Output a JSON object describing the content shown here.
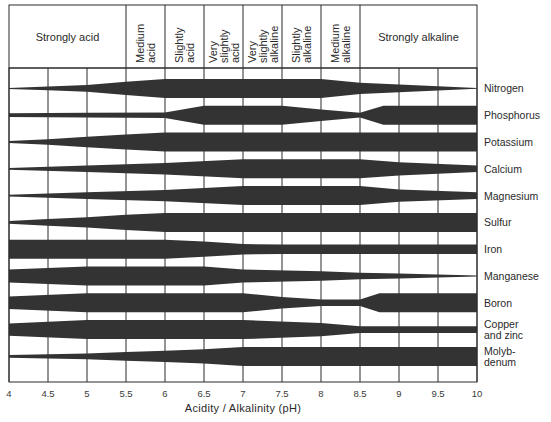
{
  "chart_data": {
    "type": "area",
    "title": "",
    "xlabel": "Acidity / Alkalinity (pH)",
    "ylabel": "",
    "xlim": [
      4,
      10
    ],
    "x_ticks": [
      "4",
      "4.5",
      "5",
      "5.5",
      "6",
      "6.5",
      "7",
      "7.5",
      "8",
      "8.5",
      "9",
      "9.5",
      "10"
    ],
    "grid": true,
    "legend": null,
    "value_meaning": "Relative nutrient availability (band thickness, 0 = none, 1 = maximum)",
    "ph_zones": [
      {
        "label": "Strongly acid",
        "lines": [
          "Strongly acid"
        ],
        "from": 4.0,
        "to": 5.5,
        "orientation": "horizontal"
      },
      {
        "label": "Medium acid",
        "lines": [
          "Medium",
          "acid"
        ],
        "from": 5.5,
        "to": 6.0,
        "orientation": "vertical"
      },
      {
        "label": "Slightly acid",
        "lines": [
          "Slightly",
          "acid"
        ],
        "from": 6.0,
        "to": 6.5,
        "orientation": "vertical"
      },
      {
        "label": "Very slightly acid",
        "lines": [
          "Very",
          "slightly",
          "acid"
        ],
        "from": 6.5,
        "to": 7.0,
        "orientation": "vertical"
      },
      {
        "label": "Very slightly alkaline",
        "lines": [
          "Very",
          "slightly",
          "alkaline"
        ],
        "from": 7.0,
        "to": 7.5,
        "orientation": "vertical"
      },
      {
        "label": "Slightly alkaline",
        "lines": [
          "Slightly",
          "alkaline"
        ],
        "from": 7.5,
        "to": 8.0,
        "orientation": "vertical"
      },
      {
        "label": "Medium alkaline",
        "lines": [
          "Medium",
          "alkaline"
        ],
        "from": 8.0,
        "to": 8.5,
        "orientation": "vertical"
      },
      {
        "label": "Strongly alkaline",
        "lines": [
          "Strongly alkaline"
        ],
        "from": 8.5,
        "to": 10.0,
        "orientation": "horizontal"
      }
    ],
    "series": [
      {
        "name": "Nitrogen",
        "label_lines": [
          "Nitrogen"
        ],
        "points": [
          [
            4,
            0.05
          ],
          [
            4.5,
            0.2
          ],
          [
            5,
            0.35
          ],
          [
            5.5,
            0.7
          ],
          [
            6,
            1
          ],
          [
            8,
            1
          ],
          [
            8.5,
            0.6
          ],
          [
            9,
            0.4
          ],
          [
            9.5,
            0.22
          ],
          [
            10,
            0.03
          ]
        ]
      },
      {
        "name": "Phosphorus",
        "label_lines": [
          "Phosphorus"
        ],
        "points": [
          [
            4,
            0.2
          ],
          [
            5,
            0.25
          ],
          [
            6,
            0.3
          ],
          [
            6.5,
            1
          ],
          [
            7.5,
            1
          ],
          [
            8,
            0.6
          ],
          [
            8.5,
            0.25
          ],
          [
            8.8,
            1
          ],
          [
            10,
            1
          ]
        ]
      },
      {
        "name": "Potassium",
        "label_lines": [
          "Potassium"
        ],
        "points": [
          [
            4,
            0.1
          ],
          [
            4.5,
            0.3
          ],
          [
            5,
            0.55
          ],
          [
            5.5,
            0.8
          ],
          [
            6,
            1
          ],
          [
            10,
            1
          ]
        ]
      },
      {
        "name": "Calcium",
        "label_lines": [
          "Calcium"
        ],
        "points": [
          [
            4,
            0.1
          ],
          [
            5,
            0.35
          ],
          [
            6,
            0.6
          ],
          [
            7,
            1
          ],
          [
            8.5,
            1
          ],
          [
            9,
            0.7
          ],
          [
            10,
            0.35
          ]
        ]
      },
      {
        "name": "Magnesium",
        "label_lines": [
          "Magnesium"
        ],
        "points": [
          [
            4,
            0.1
          ],
          [
            5,
            0.35
          ],
          [
            6,
            0.6
          ],
          [
            7,
            1
          ],
          [
            8.5,
            1
          ],
          [
            9,
            0.65
          ],
          [
            10,
            0.35
          ]
        ]
      },
      {
        "name": "Sulfur",
        "label_lines": [
          "Sulfur"
        ],
        "points": [
          [
            4,
            0.15
          ],
          [
            4.5,
            0.35
          ],
          [
            5,
            0.55
          ],
          [
            5.5,
            0.8
          ],
          [
            6,
            1
          ],
          [
            10,
            1
          ]
        ]
      },
      {
        "name": "Iron",
        "label_lines": [
          "Iron"
        ],
        "points": [
          [
            4,
            1
          ],
          [
            6,
            1
          ],
          [
            6.5,
            0.8
          ],
          [
            7,
            0.55
          ],
          [
            7.5,
            0.5
          ],
          [
            10,
            0.5
          ]
        ]
      },
      {
        "name": "Manganese",
        "label_lines": [
          "Manganese"
        ],
        "points": [
          [
            4,
            0.7
          ],
          [
            5,
            1
          ],
          [
            6.5,
            1
          ],
          [
            7,
            0.7
          ],
          [
            8,
            0.5
          ],
          [
            8.5,
            0.35
          ],
          [
            9,
            0.25
          ],
          [
            10,
            0.05
          ]
        ]
      },
      {
        "name": "Boron",
        "label_lines": [
          "Boron"
        ],
        "points": [
          [
            4,
            0.65
          ],
          [
            5,
            1
          ],
          [
            7,
            1
          ],
          [
            7.5,
            0.6
          ],
          [
            8,
            0.35
          ],
          [
            8.5,
            0.35
          ],
          [
            8.75,
            1
          ],
          [
            10,
            1
          ]
        ]
      },
      {
        "name": "Copper and zinc",
        "label_lines": [
          "Copper",
          "and zinc"
        ],
        "points": [
          [
            4,
            0.65
          ],
          [
            5,
            1
          ],
          [
            7,
            1
          ],
          [
            8,
            0.7
          ],
          [
            8.5,
            0.35
          ],
          [
            10,
            0.35
          ]
        ]
      },
      {
        "name": "Molybdenum",
        "label_lines": [
          "Molyb-",
          "denum"
        ],
        "points": [
          [
            4,
            0.15
          ],
          [
            5,
            0.3
          ],
          [
            5.5,
            0.45
          ],
          [
            6,
            0.6
          ],
          [
            6.5,
            0.75
          ],
          [
            7,
            1
          ],
          [
            10,
            1
          ]
        ]
      }
    ],
    "colors": {
      "band": "#333333",
      "grid": "#2b2b2b",
      "background": "#ffffff"
    }
  }
}
